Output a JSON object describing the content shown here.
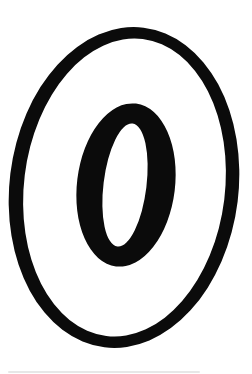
{
  "figure": {
    "background_color": "#ffffff",
    "ink_color": "#0b0b0b",
    "tilt_degrees": 7
  },
  "shapes": [
    {
      "name": "outer-oval-ring-outline",
      "cx": 124,
      "cy": 187.5,
      "rx": 114.5,
      "ry": 161,
      "rotate": 7,
      "fill": "#0b0b0b"
    },
    {
      "name": "outer-oval-ring-interior",
      "cx": 124.5,
      "cy": 187.5,
      "rx": 100.5,
      "ry": 149.5,
      "rotate": 7,
      "fill": "#ffffff"
    },
    {
      "name": "zero-glyph-body",
      "cx": 126,
      "cy": 185,
      "rx": 49,
      "ry": 82,
      "rotate": 7,
      "fill": "#0b0b0b"
    },
    {
      "name": "zero-glyph-counter-hole",
      "cx": 125,
      "cy": 185,
      "rx": 21.5,
      "ry": 62,
      "rotate": 7,
      "fill": "#ffffff"
    }
  ],
  "artifacts": {
    "bottom_scan_line_color": "#e3e3e3"
  }
}
